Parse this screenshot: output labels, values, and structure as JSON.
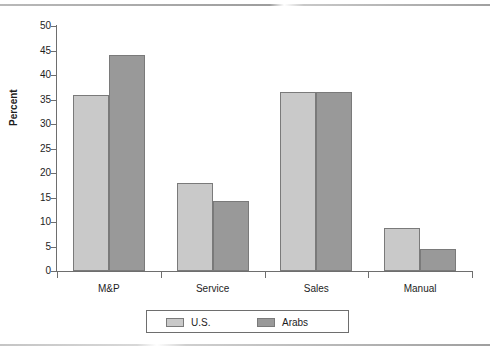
{
  "chart_data": {
    "type": "bar",
    "title": "",
    "subtitle": "",
    "xlabel": "",
    "ylabel": "Percent",
    "categories": [
      "M&P",
      "Service",
      "Sales",
      "Manual"
    ],
    "series": [
      {
        "name": "U.S.",
        "color": "#c9c9c9",
        "values": [
          36,
          18,
          36.5,
          8.7
        ]
      },
      {
        "name": "Arabs",
        "color": "#999999",
        "values": [
          44,
          14.2,
          36.5,
          4.5
        ]
      }
    ],
    "ylim": [
      0,
      50
    ],
    "ytick_values": [
      0,
      5,
      10,
      15,
      20,
      25,
      30,
      35,
      40,
      45,
      50
    ],
    "ytick_labels": [
      "0",
      "5",
      "10",
      "15",
      "20",
      "25",
      "30",
      "35",
      "40",
      "45",
      "50"
    ],
    "grid": false,
    "legend_position": "bottom",
    "legend_entries": [
      "U.S.",
      "Arabs"
    ]
  },
  "figure": {
    "axis_color": "#6e6e6e",
    "background": "#ffffff"
  }
}
